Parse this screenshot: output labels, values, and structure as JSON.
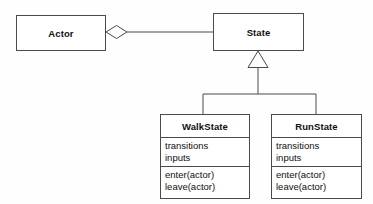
{
  "diagram": {
    "kind": "uml-class-diagram",
    "background_color": "#fefefe",
    "line_color": "#4a4a4a",
    "fill_color": "#ffffff",
    "text_color": "#101010",
    "classes": [
      {
        "id": "actor",
        "name": "Actor",
        "attributes": [],
        "operations": [],
        "box": {
          "x": 16,
          "y": 15,
          "width": 90,
          "height": 36
        }
      },
      {
        "id": "state",
        "name": "State",
        "attributes": [],
        "operations": [],
        "box": {
          "x": 213,
          "y": 13,
          "width": 91,
          "height": 38
        }
      },
      {
        "id": "walkstate",
        "name": "WalkState",
        "attributes": [
          "transitions",
          "inputs"
        ],
        "operations": [
          "enter(actor)",
          "leave(actor)"
        ],
        "box": {
          "x": 160,
          "y": 114,
          "width": 90,
          "height": 85
        }
      },
      {
        "id": "runstate",
        "name": "RunState",
        "attributes": [
          "transitions",
          "inputs"
        ],
        "operations": [
          "enter(actor)",
          "leave(actor)"
        ],
        "box": {
          "x": 271,
          "y": 114,
          "width": 91,
          "height": 85
        }
      }
    ],
    "relationships": [
      {
        "id": "actor-aggregates-state",
        "type": "aggregation",
        "source": "actor",
        "target": "state",
        "marker": "hollow-diamond",
        "marker_at": "source"
      },
      {
        "id": "walkstate-inherits-state",
        "type": "generalization",
        "source": "walkstate",
        "target": "state",
        "marker": "hollow-triangle",
        "marker_at": "target"
      },
      {
        "id": "runstate-inherits-state",
        "type": "generalization",
        "source": "runstate",
        "target": "state",
        "marker": "hollow-triangle",
        "marker_at": "target"
      }
    ]
  }
}
